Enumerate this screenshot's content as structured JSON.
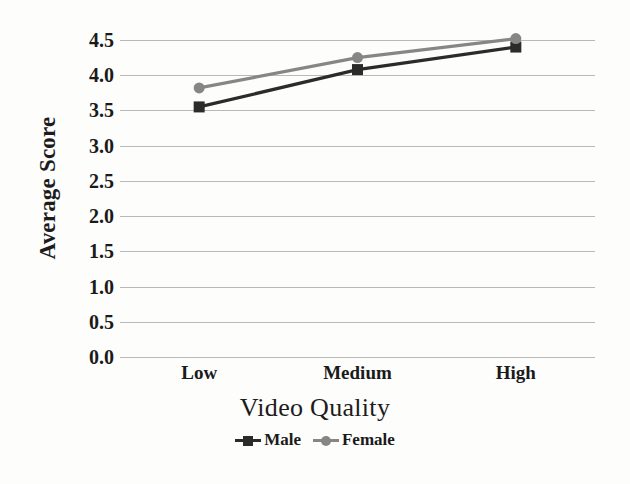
{
  "chart_data": {
    "type": "line",
    "title": "",
    "xlabel": "Video Quality",
    "ylabel": "Average Score",
    "categories": [
      "Low",
      "Medium",
      "High"
    ],
    "series": [
      {
        "name": "Male",
        "values": [
          3.55,
          4.08,
          4.4
        ],
        "color": "#2b2b2b",
        "marker": "square"
      },
      {
        "name": "Female",
        "values": [
          3.82,
          4.25,
          4.52
        ],
        "color": "#868686",
        "marker": "circle"
      }
    ],
    "ylim": [
      0.0,
      4.5
    ],
    "y_ticks": [
      "0.0",
      "0.5",
      "1.0",
      "1.5",
      "2.0",
      "2.5",
      "3.0",
      "3.5",
      "4.0",
      "4.5"
    ],
    "y_tick_values": [
      0.0,
      0.5,
      1.0,
      1.5,
      2.0,
      2.5,
      3.0,
      3.5,
      4.0,
      4.5
    ],
    "grid": true,
    "legend_position": "bottom"
  },
  "axes": {
    "y_title": "Average Score",
    "x_title": "Video Quality"
  },
  "legend": {
    "entries": [
      {
        "label": "Male",
        "color": "#2b2b2b",
        "marker": "square"
      },
      {
        "label": "Female",
        "color": "#868686",
        "marker": "circle"
      }
    ]
  },
  "colors": {
    "male": "#2b2b2b",
    "female": "#868686",
    "gridline": "#b9b9b9",
    "background": "#fdfdfc",
    "text": "#1a1a1a"
  }
}
